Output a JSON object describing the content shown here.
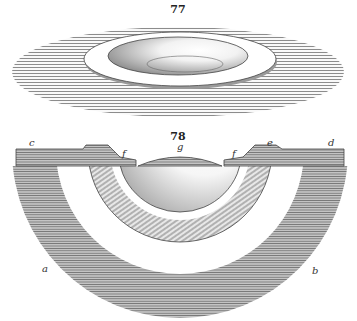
{
  "figures": [
    {
      "number": "77",
      "description": "Perspective view of a shallow bowl-shaped depression with a raised flat rim in a hatched surface"
    },
    {
      "number": "78",
      "description": "Cross-section showing concentric hemispherical layers beneath a surface",
      "labels": {
        "c": "c",
        "e": "e",
        "d": "d",
        "f_left": "f",
        "f_right": "f",
        "g": "g",
        "a": "a",
        "b": "b"
      }
    }
  ],
  "colors": {
    "paper": "#ffffff",
    "ink": "#333333",
    "hatch_light": "#9a9a9a",
    "hatch_dark": "#6a6a6a"
  }
}
